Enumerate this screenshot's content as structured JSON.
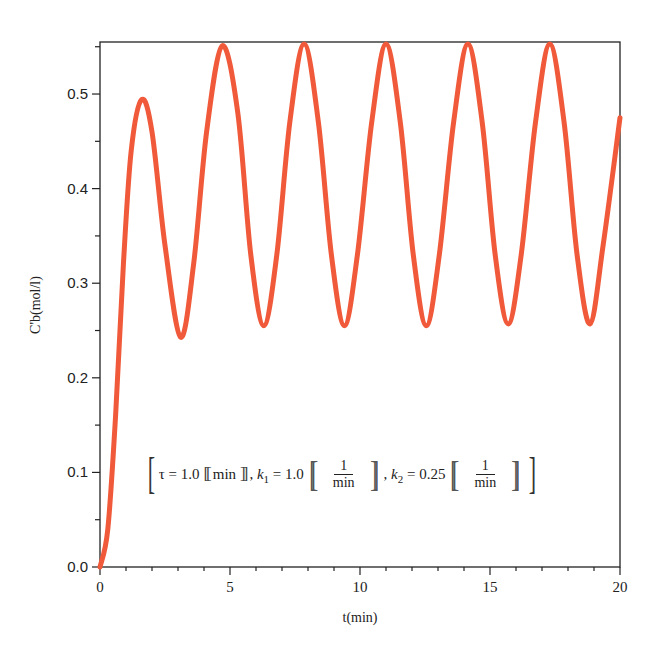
{
  "chart_data": {
    "type": "line",
    "title": "",
    "xlabel": "t(min)",
    "ylabel": "C'b(mol/l)",
    "xlim": [
      0,
      20
    ],
    "ylim": [
      0,
      0.555
    ],
    "grid": false,
    "legend": null,
    "x_ticks": [
      "0",
      "5",
      "10",
      "15",
      "20"
    ],
    "y_ticks": [
      "0.0",
      "0.1",
      "0.2",
      "0.3",
      "0.4",
      "0.5"
    ],
    "series": [
      {
        "name": "C'b",
        "color": "#f05a3a",
        "x": [
          0,
          0.3,
          0.6,
          0.9,
          1.2,
          1.6,
          2.0,
          2.5,
          3.1,
          3.6,
          4.1,
          4.7,
          5.3,
          5.8,
          6.3,
          6.8,
          7.3,
          7.85,
          8.4,
          8.9,
          9.4,
          9.9,
          10.45,
          11.0,
          11.55,
          12.05,
          12.55,
          13.05,
          13.6,
          14.15,
          14.7,
          15.2,
          15.7,
          16.2,
          16.75,
          17.3,
          17.85,
          18.35,
          18.85,
          19.35,
          20.0
        ],
        "values": [
          0.0,
          0.04,
          0.16,
          0.32,
          0.44,
          0.494,
          0.46,
          0.34,
          0.243,
          0.32,
          0.46,
          0.551,
          0.48,
          0.33,
          0.255,
          0.33,
          0.47,
          0.553,
          0.47,
          0.33,
          0.255,
          0.33,
          0.47,
          0.553,
          0.47,
          0.33,
          0.255,
          0.33,
          0.47,
          0.553,
          0.47,
          0.33,
          0.257,
          0.33,
          0.47,
          0.553,
          0.47,
          0.33,
          0.257,
          0.34,
          0.475
        ]
      }
    ],
    "annotation": "[τ = 1.0 [[min]], k1 = 1.0 [[1/min]], k2 = 0.25 [[1/min]]]"
  },
  "annotation": {
    "tau_label": "τ = 1.0",
    "tau_unit": "min",
    "k1_symbol": "k",
    "k1_sub": "1",
    "k1_value": "= 1.0",
    "k1_num": "1",
    "k1_den": "min",
    "k2_symbol": "k",
    "k2_sub": "2",
    "k2_value": "= 0.25",
    "k2_num": "1",
    "k2_den": "min",
    "sep": ","
  }
}
